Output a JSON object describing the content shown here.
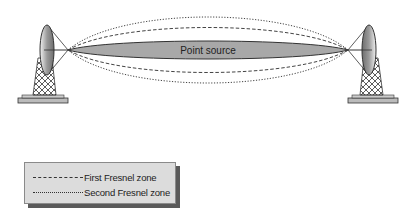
{
  "diagram": {
    "center_label": "Point source",
    "colors": {
      "lens_fill": "#a8a8a8",
      "lens_stroke": "#333333",
      "line": "#333333",
      "legend_bg": "#dcdcdc",
      "legend_shadow": "#5a5a5a"
    },
    "antennas": [
      {
        "name": "left-antenna",
        "dish_center": [
          47,
          50
        ]
      },
      {
        "name": "right-antenna",
        "dish_center": [
          369,
          50
        ]
      }
    ],
    "zones": [
      {
        "name": "first-fresnel-zone",
        "style": "dashed",
        "half_height": 24
      },
      {
        "name": "second-fresnel-zone",
        "style": "dotted",
        "half_height": 34
      }
    ]
  },
  "legend": {
    "items": [
      {
        "style": "dashed",
        "label": "First Fresnel zone"
      },
      {
        "style": "dotted",
        "label": "Second Fresnel zone"
      }
    ]
  }
}
